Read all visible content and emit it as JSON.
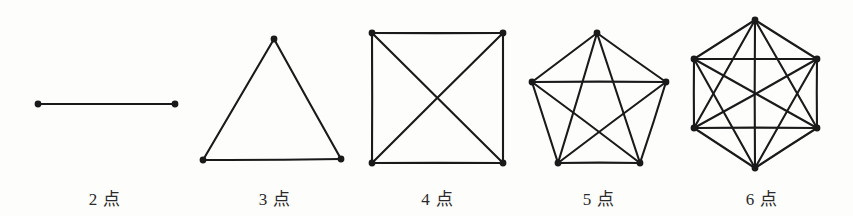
{
  "sheet": {
    "width": 853,
    "height": 216,
    "background_color": "#fdfdfc",
    "ink_color": "#1a1a1a"
  },
  "chart_data": {
    "type": "diagram",
    "subtype": "complete-graph-series",
    "title": "",
    "categories": [
      "2 点",
      "3 点",
      "4 点",
      "5 点",
      "6 点"
    ],
    "values": [
      2,
      3,
      4,
      5,
      6
    ],
    "edge_counts": [
      1,
      3,
      6,
      10,
      15
    ],
    "xlabel": "",
    "ylabel": "",
    "legend": []
  },
  "figures": [
    {
      "id": "k2",
      "caption": "2 点",
      "vertex_count": 2,
      "edge_count": 1,
      "shape": "segment",
      "viewbox": "0 0 210 180",
      "vertices": [
        {
          "x": 38,
          "y": 104
        },
        {
          "x": 175,
          "y": 104
        }
      ],
      "edges": [
        [
          0,
          1
        ]
      ]
    },
    {
      "id": "k3",
      "caption": "3 点",
      "vertex_count": 3,
      "edge_count": 3,
      "shape": "triangle",
      "viewbox": "0 0 170 180",
      "vertices": [
        {
          "x": 84,
          "y": 39
        },
        {
          "x": 13,
          "y": 160
        },
        {
          "x": 151,
          "y": 159
        }
      ],
      "edges": [
        [
          0,
          1
        ],
        [
          1,
          2
        ],
        [
          2,
          0
        ]
      ]
    },
    {
      "id": "k4",
      "caption": "4 点",
      "vertex_count": 4,
      "edge_count": 6,
      "shape": "square",
      "viewbox": "0 0 165 180",
      "vertices": [
        {
          "x": 17,
          "y": 33
        },
        {
          "x": 148,
          "y": 33
        },
        {
          "x": 148,
          "y": 163
        },
        {
          "x": 17,
          "y": 163
        }
      ],
      "edges": [
        [
          0,
          1
        ],
        [
          1,
          2
        ],
        [
          2,
          3
        ],
        [
          3,
          0
        ],
        [
          0,
          2
        ],
        [
          1,
          3
        ]
      ]
    },
    {
      "id": "k5",
      "caption": "5 点",
      "vertex_count": 5,
      "edge_count": 10,
      "shape": "pentagon",
      "viewbox": "0 0 162 180",
      "vertices": [
        {
          "x": 79,
          "y": 33
        },
        {
          "x": 148,
          "y": 82
        },
        {
          "x": 122,
          "y": 163
        },
        {
          "x": 40,
          "y": 163
        },
        {
          "x": 14,
          "y": 82
        }
      ],
      "edges": [
        [
          0,
          1
        ],
        [
          1,
          2
        ],
        [
          2,
          3
        ],
        [
          3,
          4
        ],
        [
          4,
          0
        ],
        [
          0,
          2
        ],
        [
          0,
          3
        ],
        [
          1,
          3
        ],
        [
          1,
          4
        ],
        [
          2,
          4
        ]
      ]
    },
    {
      "id": "k6",
      "caption": "6 点",
      "vertex_count": 6,
      "edge_count": 15,
      "shape": "hexagon",
      "viewbox": "0 0 160 180",
      "vertices": [
        {
          "x": 73,
          "y": 20
        },
        {
          "x": 135,
          "y": 59
        },
        {
          "x": 135,
          "y": 128
        },
        {
          "x": 73,
          "y": 168
        },
        {
          "x": 12,
          "y": 128
        },
        {
          "x": 12,
          "y": 59
        }
      ],
      "edges": [
        [
          0,
          1
        ],
        [
          1,
          2
        ],
        [
          2,
          3
        ],
        [
          3,
          4
        ],
        [
          4,
          5
        ],
        [
          5,
          0
        ],
        [
          0,
          2
        ],
        [
          0,
          3
        ],
        [
          0,
          4
        ],
        [
          1,
          3
        ],
        [
          1,
          4
        ],
        [
          1,
          5
        ],
        [
          2,
          4
        ],
        [
          2,
          5
        ],
        [
          3,
          5
        ]
      ]
    }
  ]
}
